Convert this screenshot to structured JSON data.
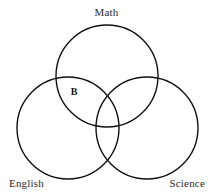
{
  "diagram": {
    "type": "venn",
    "set_count": 3,
    "stroke_color": "#111111",
    "background_color": "#ffffff",
    "text_color": "#2b2b2b",
    "sets": [
      {
        "id": "math",
        "label": "Math",
        "position": "top",
        "center_x": 107,
        "center_y": 76,
        "radius": 51
      },
      {
        "id": "english",
        "label": "English",
        "position": "bottom-left",
        "center_x": 68,
        "center_y": 128,
        "radius": 51
      },
      {
        "id": "science",
        "label": "Science",
        "position": "bottom-right",
        "center_x": 147,
        "center_y": 128,
        "radius": 51
      }
    ],
    "region_labels": [
      {
        "id": "b",
        "text": "B",
        "bold": true,
        "region": "math-and-english-only",
        "x": 74,
        "y": 92
      }
    ]
  }
}
